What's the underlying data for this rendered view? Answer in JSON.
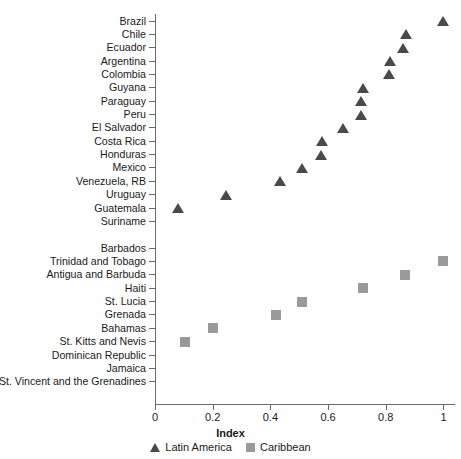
{
  "chart_data": {
    "type": "scatter",
    "title": "",
    "xlabel": "Index",
    "ylabel": "",
    "xlim": [
      0,
      1.04
    ],
    "xticks": [
      "0",
      "0.2",
      "0.4",
      "0.6",
      "0.8",
      "1"
    ],
    "xtick_values": [
      0,
      0.2,
      0.4,
      0.6,
      0.8,
      1
    ],
    "grid": false,
    "legend_position": "bottom-center",
    "orientation": "horizontal-dot",
    "categories": [
      "Brazil",
      "Chile",
      "Ecuador",
      "Argentina",
      "Colombia",
      "Guyana",
      "Paraguay",
      "Peru",
      "El Salvador",
      "Costa Rica",
      "Honduras",
      "Mexico",
      "Venezuela, RB",
      "Uruguay",
      "Guatemala",
      "Suriname",
      "",
      "Barbados",
      "Trinidad and Tobago",
      "Antigua and Barbuda",
      "Haiti",
      "St. Lucia",
      "Grenada",
      "Bahamas",
      "St. Kitts and Nevis",
      "Dominican Republic",
      "Jamaica",
      "St. Vincent and the Grenadines"
    ],
    "series": [
      {
        "name": "Latin America",
        "marker": "triangle",
        "color": "#4a4a4a",
        "points": [
          {
            "label": "Brazil",
            "value": 1.0
          },
          {
            "label": "Chile",
            "value": 0.87
          },
          {
            "label": "Ecuador",
            "value": 0.86
          },
          {
            "label": "Argentina",
            "value": 0.815
          },
          {
            "label": "Colombia",
            "value": 0.81
          },
          {
            "label": "Guyana",
            "value": 0.72
          },
          {
            "label": "Paraguay",
            "value": 0.715
          },
          {
            "label": "Peru",
            "value": 0.715
          },
          {
            "label": "El Salvador",
            "value": 0.65
          },
          {
            "label": "Costa Rica",
            "value": 0.58
          },
          {
            "label": "Honduras",
            "value": 0.575
          },
          {
            "label": "Mexico",
            "value": 0.51
          },
          {
            "label": "Venezuela, RB",
            "value": 0.435
          },
          {
            "label": "Uruguay",
            "value": 0.245
          },
          {
            "label": "Guatemala",
            "value": 0.08
          },
          {
            "label": "Suriname",
            "value": null
          }
        ]
      },
      {
        "name": "Caribbean",
        "marker": "square",
        "color": "#9a9a9a",
        "points": [
          {
            "label": "Barbados",
            "value": null
          },
          {
            "label": "Trinidad and Tobago",
            "value": 1.0
          },
          {
            "label": "Antigua and Barbuda",
            "value": 0.865
          },
          {
            "label": "Haiti",
            "value": 0.72
          },
          {
            "label": "St. Lucia",
            "value": 0.51
          },
          {
            "label": "Grenada",
            "value": 0.42
          },
          {
            "label": "Bahamas",
            "value": 0.2
          },
          {
            "label": "St. Kitts and Nevis",
            "value": 0.105
          },
          {
            "label": "Dominican Republic",
            "value": null
          },
          {
            "label": "Jamaica",
            "value": null
          },
          {
            "label": "St. Vincent and the Grenadines",
            "value": null
          }
        ]
      }
    ],
    "legend": [
      {
        "label": "Latin America",
        "marker": "triangle",
        "color": "#4a4a4a"
      },
      {
        "label": "Caribbean",
        "marker": "square",
        "color": "#9a9a9a"
      }
    ]
  },
  "axis": {
    "x_title": "Index"
  }
}
